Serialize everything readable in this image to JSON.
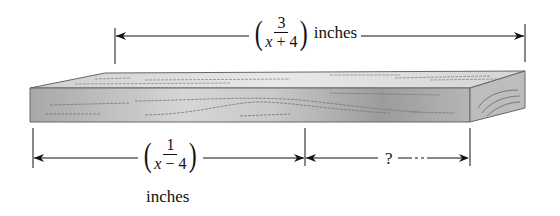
{
  "figure": {
    "total_length": {
      "numerator": "3",
      "denominator_var": "x",
      "denominator_rest": " + 4",
      "unit": "inches"
    },
    "left_segment": {
      "numerator": "1",
      "denominator_var": "x",
      "denominator_rest": " − 4",
      "unit": "inches"
    },
    "right_segment": {
      "label": "?"
    },
    "colors": {
      "line": "#111111",
      "wood_front_light": "#d9d9d9",
      "wood_front_dark": "#9a9a9a",
      "wood_top": "#e2e2e2",
      "wood_end": "#bdbdbd",
      "grain": "#7a7a7a"
    }
  }
}
